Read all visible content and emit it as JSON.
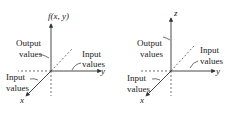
{
  "diagrams": [
    {
      "vertical_axis_label": "f(x, y)",
      "output_label": [
        "Output",
        "values"
      ],
      "input_y_label": [
        "Input",
        "values"
      ],
      "input_x_label": [
        "Input",
        "values"
      ],
      "x_axis": "x",
      "y_axis": "y"
    },
    {
      "vertical_axis_label": "z",
      "output_label": [
        "Output",
        "values"
      ],
      "input_y_label": [
        "Input",
        "values"
      ],
      "input_x_label": [
        "Input",
        "values"
      ],
      "x_axis": "x",
      "y_axis": "y"
    }
  ],
  "colors": {
    "line": "#333333"
  }
}
